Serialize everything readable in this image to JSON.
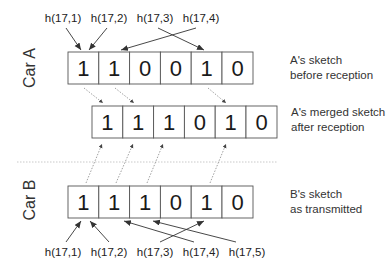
{
  "cars": {
    "a": {
      "label": "Car A"
    },
    "b": {
      "label": "Car B"
    }
  },
  "rows": {
    "a_before": {
      "bits": [
        "1",
        "1",
        "0",
        "0",
        "1",
        "0"
      ],
      "caption_line1": "A's sketch",
      "caption_line2": "before reception"
    },
    "a_merged": {
      "bits": [
        "1",
        "1",
        "1",
        "0",
        "1",
        "0"
      ],
      "caption_line1": "A's merged sketch",
      "caption_line2": "after reception"
    },
    "b_transmitted": {
      "bits": [
        "1",
        "1",
        "1",
        "0",
        "1",
        "0"
      ],
      "caption_line1": "B's sketch",
      "caption_line2": "as transmitted"
    }
  },
  "hash_labels_top": [
    "h(17,1)",
    "h(17,2)",
    "h(17,3)",
    "h(17,4)"
  ],
  "hash_labels_bottom": [
    "h(17,1)",
    "h(17,2)",
    "h(17,3)",
    "h(17,4)",
    "h(17,5)"
  ],
  "colors": {
    "box_stroke": "#555555",
    "arrow": "#333333",
    "dotted_arrow": "#777777",
    "separator": "#bbbbbb"
  }
}
